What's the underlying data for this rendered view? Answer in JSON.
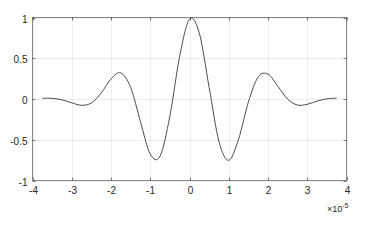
{
  "chart_data": {
    "type": "line",
    "title": "",
    "xlabel": "",
    "ylabel": "",
    "xlim": [
      -4,
      4
    ],
    "ylim": [
      -1,
      1
    ],
    "x_scale_multiplier": "×10^-5",
    "x_ticks": [
      -4,
      -3,
      -2,
      -1,
      0,
      1,
      2,
      3,
      4
    ],
    "x_tick_labels": [
      "-4",
      "-3",
      "-2",
      "-1",
      "0",
      "1",
      "2",
      "3",
      "4"
    ],
    "y_ticks": [
      -1,
      -0.5,
      0,
      0.5,
      1
    ],
    "y_tick_labels": [
      "-1",
      "-0.5",
      "0",
      "0.5",
      "1"
    ],
    "grid": true,
    "legend": null,
    "series": [
      {
        "name": "signal",
        "color": "#4d4d4d",
        "x": [
          -3.75,
          -3.5,
          -3.25,
          -3.0,
          -2.75,
          -2.5,
          -2.25,
          -2.0,
          -1.75,
          -1.5,
          -1.25,
          -1.0,
          -0.75,
          -0.5,
          -0.25,
          0,
          0.25,
          0.5,
          0.75,
          1.0,
          1.25,
          1.5,
          1.75,
          2.0,
          2.25,
          2.5,
          2.75,
          3.0,
          3.25,
          3.5,
          3.75
        ],
        "values": [
          0.01,
          0.008,
          -0.01,
          -0.047,
          -0.077,
          -0.049,
          0.074,
          0.246,
          0.32,
          0.143,
          -0.277,
          -0.676,
          -0.7,
          -0.209,
          0.525,
          0.98,
          0.809,
          0.143,
          -0.521,
          -0.752,
          -0.494,
          -0.038,
          0.271,
          0.305,
          0.157,
          -0.001,
          -0.074,
          -0.065,
          -0.026,
          0.002,
          0.011
        ]
      }
    ]
  },
  "axis_multiplier": {
    "base": "×10",
    "exponent": "-5"
  }
}
